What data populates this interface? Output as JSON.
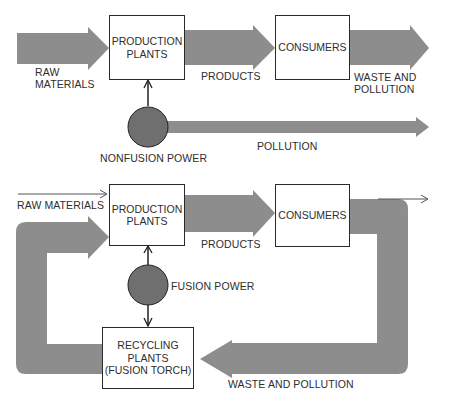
{
  "colors": {
    "flow_band": "#8d8d8d",
    "power_circle": "#6f6f6f",
    "box_border": "#2a2a2a",
    "text": "#2e2e2e"
  },
  "top_diagram": {
    "raw_materials": "RAW",
    "raw_materials_2": "MATERIALS",
    "production_plants": "PRODUCTION",
    "production_plants_2": "PLANTS",
    "products": "PRODUCTS",
    "consumers": "CONSUMERS",
    "waste": "WASTE AND",
    "waste_2": "POLLUTION",
    "power": "NONFUSION POWER",
    "pollution": "POLLUTION"
  },
  "bottom_diagram": {
    "raw_materials": "RAW MATERIALS",
    "production_plants": "PRODUCTION",
    "production_plants_2": "PLANTS",
    "products": "PRODUCTS",
    "consumers": "CONSUMERS",
    "power": "FUSION POWER",
    "recycling": "RECYCLING",
    "recycling_2": "PLANTS",
    "recycling_3": "(FUSION TORCH)",
    "waste": "WASTE AND POLLUTION"
  }
}
